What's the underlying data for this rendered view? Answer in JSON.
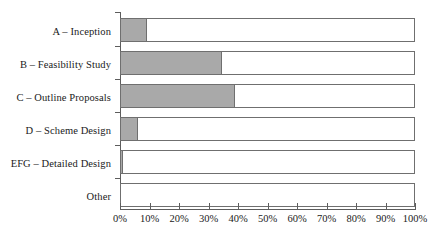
{
  "chart_data": {
    "type": "bar",
    "orientation": "horizontal",
    "stacked": true,
    "title": "",
    "subtitle": "",
    "xlabel": "",
    "ylabel": "",
    "categories": [
      "A – Inception",
      "B – Feasibility Study",
      "C – Outline Proposals",
      "D – Scheme Design",
      "EFG – Detailed Design",
      "Other"
    ],
    "series": [
      {
        "name": "filled",
        "color": "#a9a9a9",
        "values": [
          9,
          34.5,
          39,
          6,
          1,
          0
        ]
      },
      {
        "name": "remainder",
        "color": "#ffffff",
        "values": [
          91,
          65.5,
          61,
          94,
          99,
          100
        ]
      }
    ],
    "values": [
      9,
      34.5,
      39,
      6,
      1,
      0
    ],
    "xlim": [
      0,
      100
    ],
    "xticks": [
      0,
      10,
      20,
      30,
      40,
      50,
      60,
      70,
      80,
      90,
      100
    ],
    "xtick_labels": [
      "0%",
      "10%",
      "20%",
      "30%",
      "40%",
      "50%",
      "60%",
      "70%",
      "80%",
      "90%",
      "100%"
    ],
    "grid": false,
    "legend": null,
    "annotations": []
  },
  "style": {
    "fill_color": "#a9a9a9",
    "bar_outline_color": "#6f6f6f",
    "axis_color": "#5d5d5d",
    "text_color": "#1a1a1a",
    "background": "#ffffff"
  }
}
